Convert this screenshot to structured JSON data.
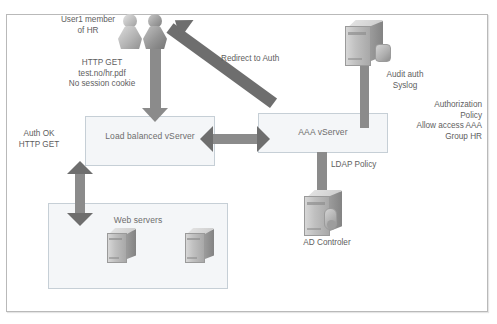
{
  "diagram": {
    "frame": {
      "name": "outer-border"
    },
    "zones": [
      {
        "id": "lb",
        "label": "Load balanced vServer"
      },
      {
        "id": "aaa",
        "label": "AAA vServer"
      },
      {
        "id": "web",
        "label": "Web servers"
      }
    ],
    "annotations": {
      "user_label": "User1 member\nof HR",
      "http_get_request": "HTTP GET\ntest.no/hr.pdf\nNo session cookie",
      "redirect_label": "Redirect to Auth",
      "auth_ok": "Auth OK\nHTTP GET",
      "audit_auth": "Audit auth\nSyslog",
      "authorization_policy": "Authorization\nPolicy\nAllow access AAA\nGroup HR",
      "ldap_policy": "LDAP Policy",
      "ad_controller": "AD Controler"
    },
    "icons": [
      {
        "name": "user-person-icon-1",
        "kind": "person"
      },
      {
        "name": "user-person-icon-2",
        "kind": "person-dark"
      },
      {
        "name": "syslog-server-icon",
        "kind": "tower"
      },
      {
        "name": "ad-controller-icon",
        "kind": "tower"
      },
      {
        "name": "web-server-icon-1",
        "kind": "tower-small"
      },
      {
        "name": "web-server-icon-2",
        "kind": "tower-small"
      }
    ],
    "arrows": [
      {
        "name": "arrow-user-to-lb",
        "direction": "down",
        "meaning": "HTTP GET test.no/hr.pdf"
      },
      {
        "name": "arrow-aaa-to-user",
        "direction": "diagonal-up-left",
        "meaning": "Redirect to Auth"
      },
      {
        "name": "arrow-lb-to-aaa",
        "direction": "bidirectional-horizontal"
      },
      {
        "name": "arrow-lb-to-webservers",
        "direction": "bidirectional-vertical",
        "meaning": "Auth OK HTTP GET"
      },
      {
        "name": "arrow-aaa-to-ad",
        "direction": "down",
        "meaning": "LDAP Policy"
      },
      {
        "name": "arrow-syslog-to-aaa",
        "direction": "down",
        "meaning": "Audit auth Syslog"
      }
    ],
    "colors": {
      "arrow": "#6e6e6e",
      "zone_fill": "#f4f6f8",
      "zone_border": "#c6cfd6",
      "text": "#5e5e5e",
      "frame_border": "#b9b9b9"
    }
  }
}
